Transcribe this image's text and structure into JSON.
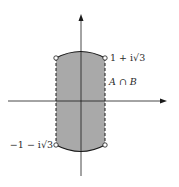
{
  "diagram": {
    "type": "complex-plane-region",
    "region_fill": "#a9a9a9",
    "line_color": "#1a1a1a",
    "labels": {
      "top_right_point": "1 + i√3",
      "bottom_left_point": "−1 − i√3",
      "region": "A ∩ B"
    },
    "points": [
      {
        "name": "top-left",
        "open": true
      },
      {
        "name": "top-right",
        "open": true,
        "label": "1 + i√3"
      },
      {
        "name": "bottom-left",
        "open": true,
        "label": "−1 − i√3"
      },
      {
        "name": "bottom-right",
        "open": true
      }
    ],
    "boundaries": {
      "left": "dashed",
      "right": "dashed",
      "top": "solid arc",
      "bottom": "solid arc"
    },
    "axes": {
      "horizontal": "real axis (arrow right)",
      "vertical": "imaginary axis (arrow up)"
    }
  }
}
